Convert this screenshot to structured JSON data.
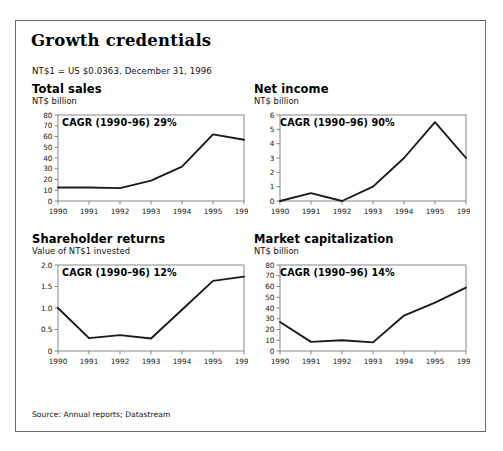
{
  "figure": {
    "title": "Growth credentials",
    "fx_note": "NT$1 = US $0.0363, December 31, 1996",
    "source": "Source: Annual reports; Datastream",
    "frame_color": "#6b6b6b",
    "line_color": "#1a1a1a",
    "background": "#ffffff"
  },
  "chart_data": [
    {
      "type": "line",
      "title": "Total sales",
      "subtitle": "NT$ billion",
      "ylabel": "NT$ billion",
      "xlabel": "",
      "annotation": "CAGR (1990–96) 29%",
      "categories": [
        "1990",
        "1991",
        "1992",
        "1993",
        "1994",
        "1995",
        "1996"
      ],
      "values": [
        12.5,
        12.5,
        12.0,
        19.0,
        32.0,
        62.0,
        57.0
      ],
      "yticks": [
        0,
        10,
        20,
        30,
        40,
        50,
        60,
        70,
        80
      ],
      "ylim": [
        0,
        80
      ],
      "grid": false,
      "legend": "none"
    },
    {
      "type": "line",
      "title": "Net income",
      "subtitle": "NT$ billion",
      "ylabel": "NT$ billion",
      "xlabel": "",
      "annotation": "CAGR (1990–96) 90%",
      "categories": [
        "1990",
        "1991",
        "1992",
        "1993",
        "1994",
        "1995",
        "1996"
      ],
      "values": [
        0.0,
        0.55,
        0.0,
        1.0,
        3.0,
        5.5,
        3.0
      ],
      "yticks": [
        0,
        1,
        2,
        3,
        4,
        5,
        6
      ],
      "ylim": [
        0,
        6
      ],
      "grid": false,
      "legend": "none"
    },
    {
      "type": "line",
      "title": "Shareholder returns",
      "subtitle": "Value of NT$1 invested",
      "ylabel": "Value of NT$1 invested",
      "xlabel": "",
      "annotation": "CAGR (1990–96) 12%",
      "categories": [
        "1990",
        "1991",
        "1992",
        "1993",
        "1994",
        "1995",
        "1996"
      ],
      "values": [
        1.0,
        0.3,
        0.37,
        0.29,
        0.96,
        1.63,
        1.73
      ],
      "yticks": [
        0,
        0.5,
        1.0,
        1.5,
        2.0
      ],
      "ytick_labels": [
        "0",
        "0.5",
        "1.0",
        "1.5",
        "2.0"
      ],
      "ylim": [
        0,
        2.0
      ],
      "grid": false,
      "legend": "none"
    },
    {
      "type": "line",
      "title": "Market capitalization",
      "subtitle": "NT$ billion",
      "ylabel": "NT$ billion",
      "xlabel": "",
      "annotation": "CAGR (1990–96) 14%",
      "categories": [
        "1990",
        "1991",
        "1992",
        "1993",
        "1994",
        "1995",
        "1996"
      ],
      "values": [
        27.0,
        8.5,
        10.0,
        8.0,
        33.0,
        45.0,
        59.0
      ],
      "yticks": [
        0,
        10,
        20,
        30,
        40,
        50,
        60,
        70,
        80
      ],
      "ylim": [
        0,
        80
      ],
      "grid": false,
      "legend": "none"
    }
  ]
}
